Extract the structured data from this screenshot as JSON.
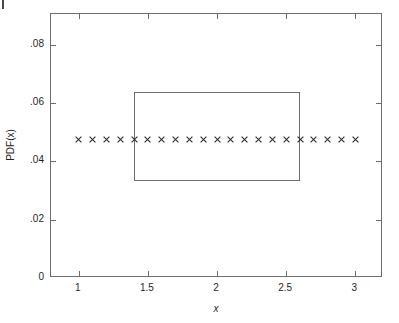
{
  "figure": {
    "background_color": "#ffffff",
    "axis_color": "#6d6d6d",
    "text_color": "#1f1f1f",
    "marker_color": "#2b2b2b"
  },
  "axes": {
    "xlabel": "x",
    "ylabel": "PDF(x)",
    "xticklabels": [
      "1",
      "1.5",
      "2",
      "2.5",
      "3"
    ],
    "yticklabels": [
      "0",
      ".02",
      ".04",
      ".06",
      ".08"
    ]
  },
  "chart_data": {
    "type": "scatter",
    "title": "",
    "xlabel": "x",
    "ylabel": "PDF(x)",
    "xlim": [
      0.8,
      3.2
    ],
    "ylim": [
      0,
      0.0905
    ],
    "xticks": [
      1,
      1.5,
      2,
      2.5,
      3
    ],
    "yticks": [
      0,
      0.02,
      0.04,
      0.06,
      0.08
    ],
    "xticklabels": [
      "1",
      "1.5",
      "2",
      "2.5",
      "3"
    ],
    "yticklabels": [
      "0",
      ".02",
      ".04",
      ".06",
      ".08"
    ],
    "grid": false,
    "legend": null,
    "series": [
      {
        "name": "empirical PDF estimate",
        "type": "scatter",
        "marker": "x",
        "x": [
          1.0,
          1.1,
          1.2,
          1.3,
          1.4,
          1.5,
          1.6,
          1.7,
          1.8,
          1.9,
          2.0,
          2.1,
          2.2,
          2.3,
          2.4,
          2.5,
          2.6,
          2.7,
          2.8,
          2.9,
          3.0
        ],
        "y": [
          0.0476,
          0.0476,
          0.0476,
          0.0476,
          0.0476,
          0.0476,
          0.0476,
          0.0476,
          0.0476,
          0.0476,
          0.0476,
          0.0476,
          0.0476,
          0.0476,
          0.0476,
          0.0476,
          0.0476,
          0.0476,
          0.0476,
          0.0476,
          0.0476
        ]
      },
      {
        "name": "uniform PDF rectangle",
        "type": "rectangle",
        "x0": 1.4,
        "x1": 2.6,
        "y0": 0.0333,
        "y1": 0.0637
      }
    ]
  }
}
